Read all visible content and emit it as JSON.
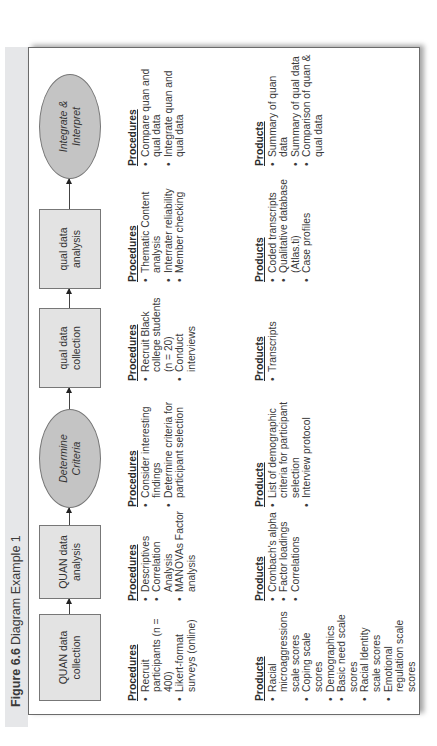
{
  "figure": {
    "label": "Figure 6.6",
    "title": "Diagram Example 1"
  },
  "flow": [
    {
      "id": "quan-collection",
      "label": "QUAN data collection",
      "shape": "rectangle"
    },
    {
      "id": "quan-analysis",
      "label": "QUAN data analysis",
      "shape": "rectangle"
    },
    {
      "id": "determine-criteria",
      "label": "Determine Criteria",
      "shape": "oval"
    },
    {
      "id": "qual-collection",
      "label": "qual data collection",
      "shape": "rectangle"
    },
    {
      "id": "qual-analysis",
      "label": "qual data analysis",
      "shape": "rectangle"
    },
    {
      "id": "integrate",
      "label": "Integrate & Interpret",
      "shape": "oval"
    }
  ],
  "headings": {
    "procedures": "Procedures",
    "products": "Products"
  },
  "columns": [
    {
      "procedures": [
        "Recruit participants (n = 400)",
        "Likert-format surveys (online)"
      ],
      "products": [
        "Racial microaggressions scale scores",
        "Coping scale scores",
        "Demographics",
        "Basic need scale scores",
        "Racial Identity scale scores",
        "Emotional regulation scale scores"
      ]
    },
    {
      "procedures": [
        "Descriptives",
        "Correlation Analysis",
        "MANOVAs Factor analysis"
      ],
      "products": [
        "Cronbach's alpha",
        "Factor loadings",
        "Correlations"
      ]
    },
    {
      "procedures": [
        "Consider interesting findings",
        "Determine criteria for participant selection"
      ],
      "products": [
        "List of demographic criteria for participant selection",
        "Interview protocol"
      ]
    },
    {
      "procedures": [
        "Recruit Black college students (n = 20)",
        "Conduct interviews"
      ],
      "products": [
        "Transcripts"
      ]
    },
    {
      "procedures": [
        "Thematic Content analysis",
        "Interrater reliability",
        "Member checking"
      ],
      "products": [
        "Coded transcripts",
        "Qualitative database (Atlas.ti)",
        "Case profiles"
      ]
    },
    {
      "procedures": [
        "Compare quan and qual data",
        "Integrate quan and qual data"
      ],
      "products": [
        "Summary of quan data",
        "Summary of qual data",
        "Comparison of quan & qual data"
      ]
    }
  ],
  "colors": {
    "rect_fill": "#e3e3e3",
    "oval_fill": "#c4c4c4",
    "title_strip": "#e6e7e9"
  }
}
